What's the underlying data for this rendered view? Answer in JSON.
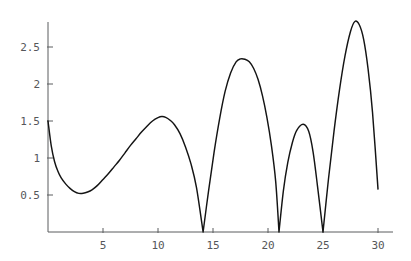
{
  "chart_data": {
    "type": "line",
    "title": "",
    "subtitle": "",
    "xlabel": "",
    "ylabel": "",
    "xlim": [
      0,
      30
    ],
    "ylim": [
      0,
      2.95
    ],
    "grid": false,
    "legend": null,
    "x_ticks": [
      5,
      10,
      15,
      20,
      25,
      30
    ],
    "x_tick_labels": [
      "5",
      "10",
      "15",
      "20",
      "25",
      "30"
    ],
    "y_ticks": [
      0.5,
      1,
      1.5,
      2,
      2.5
    ],
    "y_tick_labels": [
      "0.5",
      "1",
      "1.5",
      "2",
      "2.5"
    ],
    "line_color": "#141414",
    "axis_color": "#5a5c5f",
    "background_color": "#ffffff",
    "series": [
      {
        "name": "curve",
        "x": [
          0.0,
          0.3,
          0.6,
          0.9,
          1.2,
          1.6,
          2.0,
          2.4,
          2.8,
          3.2,
          3.6,
          4.0,
          4.5,
          5.0,
          5.5,
          6.0,
          6.5,
          7.0,
          7.5,
          8.0,
          8.5,
          9.0,
          9.5,
          10.0,
          10.35,
          10.7,
          11.1,
          11.5,
          12.0,
          12.5,
          13.0,
          13.5,
          14.1,
          14.6,
          15.1,
          15.6,
          16.1,
          16.6,
          17.1,
          17.5,
          17.9,
          18.3,
          18.7,
          19.1,
          19.5,
          19.9,
          20.3,
          20.7,
          21.0,
          21.4,
          21.8,
          22.2,
          22.6,
          23.2,
          23.7,
          24.1,
          24.5,
          25.0,
          25.5,
          26.0,
          26.5,
          27.0,
          27.5,
          27.9,
          28.3,
          28.7,
          29.1,
          29.5,
          30.0
        ],
        "y": [
          1.5,
          1.16,
          0.95,
          0.82,
          0.73,
          0.65,
          0.59,
          0.545,
          0.522,
          0.523,
          0.54,
          0.57,
          0.63,
          0.71,
          0.79,
          0.88,
          0.97,
          1.07,
          1.17,
          1.26,
          1.35,
          1.43,
          1.5,
          1.545,
          1.56,
          1.55,
          1.51,
          1.45,
          1.33,
          1.15,
          0.92,
          0.6,
          0.0,
          0.56,
          1.08,
          1.53,
          1.9,
          2.15,
          2.3,
          2.34,
          2.335,
          2.3,
          2.21,
          2.06,
          1.84,
          1.55,
          1.18,
          0.68,
          0.0,
          0.56,
          0.94,
          1.2,
          1.37,
          1.455,
          1.36,
          1.08,
          0.62,
          0.0,
          0.72,
          1.36,
          1.92,
          2.38,
          2.71,
          2.845,
          2.8,
          2.6,
          2.2,
          1.62,
          0.58
        ]
      }
    ]
  },
  "axes": {
    "y_axis_name": "vertical-axis",
    "x_axis_name": "horizontal-axis"
  }
}
